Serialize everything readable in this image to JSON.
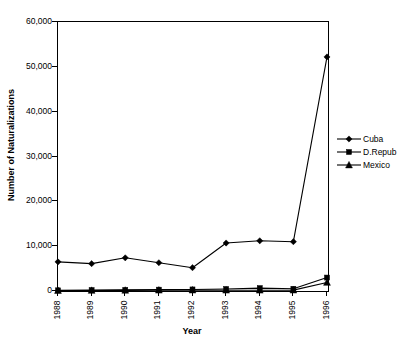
{
  "chart_data": {
    "type": "line",
    "title": "",
    "xlabel": "Year",
    "ylabel": "Number of Naturalizations",
    "categories": [
      "1988",
      "1989",
      "1990",
      "1991",
      "1992",
      "1993",
      "1994",
      "1995",
      "1996"
    ],
    "ylim": [
      0,
      60000
    ],
    "yticks": [
      0,
      10000,
      20000,
      30000,
      40000,
      50000,
      60000
    ],
    "ytick_labels": [
      "0",
      "10,000",
      "20,000",
      "30,000",
      "40,000",
      "50,000",
      "60,000"
    ],
    "grid": false,
    "legend_position": "right",
    "series": [
      {
        "name": "Cuba",
        "marker": "diamond",
        "color": "#000000",
        "values": [
          6500,
          6100,
          7400,
          6300,
          5200,
          10700,
          11200,
          11000,
          52200
        ]
      },
      {
        "name": "D.Repub",
        "marker": "square",
        "color": "#000000",
        "values": [
          150,
          200,
          250,
          300,
          350,
          450,
          650,
          500,
          3000
        ]
      },
      {
        "name": "Mexico",
        "marker": "triangle",
        "color": "#000000",
        "values": [
          100,
          120,
          150,
          180,
          200,
          180,
          170,
          200,
          1900
        ]
      }
    ]
  },
  "axes": {
    "y_title": "Number of Naturalizations",
    "x_title": "Year"
  },
  "legend": {
    "items": [
      {
        "label": "Cuba",
        "marker": "diamond-marker"
      },
      {
        "label": "D.Repub",
        "marker": "square-marker"
      },
      {
        "label": "Mexico",
        "marker": "triangle-marker"
      }
    ]
  }
}
